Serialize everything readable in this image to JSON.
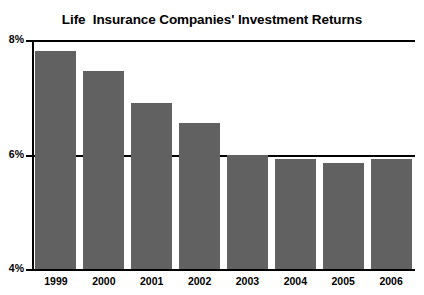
{
  "chart_data": {
    "type": "bar",
    "title": "Life  Insurance Companies' Investment Returns",
    "xlabel": "",
    "ylabel": "",
    "categories": [
      "1999",
      "2000",
      "2001",
      "2002",
      "2003",
      "2004",
      "2005",
      "2006"
    ],
    "values": [
      7.8,
      7.45,
      6.9,
      6.55,
      6.0,
      5.93,
      5.85,
      5.92
    ],
    "value_unit": "%",
    "ylim": [
      4,
      8
    ],
    "ytick_labels": [
      "8%",
      "6%",
      "4%"
    ],
    "ytick_values": [
      8,
      6,
      4
    ],
    "grid": true,
    "gridlines_at": [
      8,
      6,
      4
    ],
    "legend": null,
    "legend_position": "none",
    "series": [
      {
        "name": "Investment return",
        "color": "#616161",
        "values": [
          7.8,
          7.45,
          6.9,
          6.55,
          6.0,
          5.93,
          5.85,
          5.92
        ]
      }
    ]
  },
  "figure": {
    "clipped_header_text": "",
    "source_note_text": "",
    "bar_color": "#616161",
    "axis_color": "#000000",
    "background": "#ffffff"
  }
}
